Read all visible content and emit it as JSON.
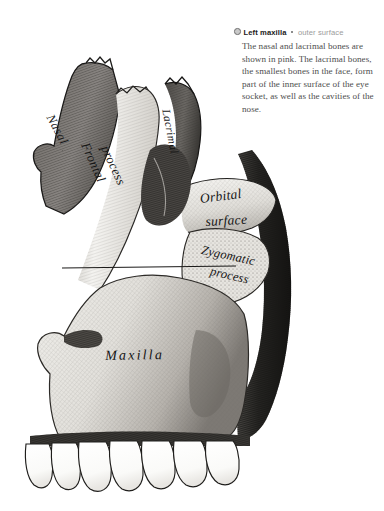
{
  "caption": {
    "bullet_icon": "filled-circle-bullet-icon",
    "separator_icon": "square-separator-icon",
    "title": "Left maxilla",
    "subtitle": "outer surface",
    "body": "The nasal and lacrimal bones are shown in pink. The lacrimal bones, the smallest bones in the face, form part of the inner surface of the eye socket, as well as the cavities of the nose."
  },
  "illustration": {
    "name": "left-maxilla-engraving",
    "alt": "Anatomical engraving of the outer surface of the left maxilla",
    "labels": {
      "nasal": "Nasal",
      "frontal_process_line1": "Frontal",
      "frontal_process_line2": "process",
      "lacrimal": "Lacrimal",
      "orbital_surface_line1": "Orbital",
      "orbital_surface_line2": "surface",
      "zygomatic_process_line1": "Zygomatic",
      "zygomatic_process_line2": "process",
      "maxilla": "Maxilla"
    },
    "teeth_count": 7
  },
  "colors": {
    "background": "#ffffff",
    "title_text": "#1b1b1b",
    "subtitle_text": "#9b9b9b",
    "body_text": "#4d4d4d",
    "bone_light": "#f2f1ee",
    "bone_mid": "#b9b6b0",
    "bone_dark": "#6d6a66",
    "shadow_dark": "#2a2826",
    "ink": "#151515",
    "tooth_white": "#fdfdfc"
  }
}
